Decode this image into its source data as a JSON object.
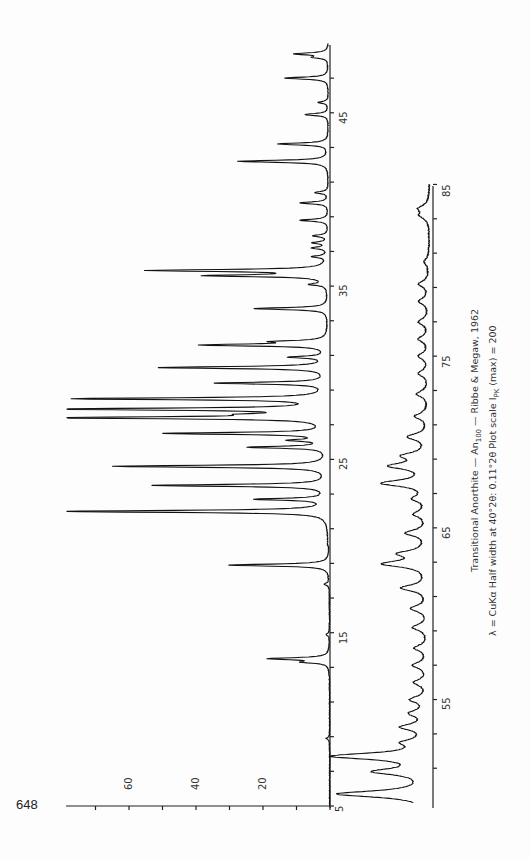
{
  "page": {
    "page_number": "648"
  },
  "caption": {
    "line1_prefix": "Transitional Anorthite — An",
    "line1_subscript": "100",
    "line1_suffix": " — Ribbe & Megaw, 1962",
    "line2_prefix": "λ = CuKα   Half width at 40°2θ: 0.11°2θ   Plot scale I",
    "line2_subscript": "PK",
    "line2_suffix": " (max) = 200"
  },
  "chart_data": {
    "type": "line",
    "title": "Transitional Anorthite — An100 — Ribbe & Megaw, 1962",
    "subtitle": "λ = CuKα  Half width at 40°2θ: 0.11°2θ  Plot scale I_PK (max) = 200",
    "xlabel": "2θ (degrees)",
    "ylabel": "Intensity",
    "orientation": "rotated 90° (2θ increases upward on page, intensity increases leftward)",
    "grid": false,
    "intensity_axis": {
      "ticks": [
        0,
        10,
        20,
        30,
        40,
        50,
        60,
        70
      ],
      "tick_labels": [
        "20",
        "40",
        "60"
      ],
      "range": [
        0,
        80
      ]
    },
    "series": [
      {
        "name": "upper trace (5–49° 2θ)",
        "xlim": [
          5,
          49
        ],
        "x_tick_labels": [
          "5",
          "15",
          "25",
          "35",
          "45"
        ],
        "x_ticks": [
          5,
          7,
          9,
          11,
          13,
          15,
          17,
          19,
          21,
          23,
          25,
          27,
          29,
          31,
          33,
          35,
          37,
          39,
          41,
          43,
          45,
          47
        ],
        "peaks": [
          {
            "two_theta": 8.9,
            "intensity": 1
          },
          {
            "two_theta": 13.3,
            "intensity": 7
          },
          {
            "two_theta": 13.5,
            "intensity": 18
          },
          {
            "two_theta": 14.9,
            "intensity": 1
          },
          {
            "two_theta": 17.8,
            "intensity": 1.5
          },
          {
            "two_theta": 18.9,
            "intensity": 30
          },
          {
            "two_theta": 22.0,
            "intensity": 80
          },
          {
            "two_theta": 22.7,
            "intensity": 21
          },
          {
            "two_theta": 23.5,
            "intensity": 52
          },
          {
            "two_theta": 24.6,
            "intensity": 64
          },
          {
            "two_theta": 25.7,
            "intensity": 23
          },
          {
            "two_theta": 26.1,
            "intensity": 10
          },
          {
            "two_theta": 26.5,
            "intensity": 48
          },
          {
            "two_theta": 27.4,
            "intensity": 80
          },
          {
            "two_theta": 27.6,
            "intensity": 15
          },
          {
            "two_theta": 27.9,
            "intensity": 80
          },
          {
            "two_theta": 28.5,
            "intensity": 75
          },
          {
            "two_theta": 29.4,
            "intensity": 33
          },
          {
            "two_theta": 30.3,
            "intensity": 50
          },
          {
            "two_theta": 30.9,
            "intensity": 11
          },
          {
            "two_theta": 31.6,
            "intensity": 37
          },
          {
            "two_theta": 31.8,
            "intensity": 14
          },
          {
            "two_theta": 33.7,
            "intensity": 22
          },
          {
            "two_theta": 35.1,
            "intensity": 5
          },
          {
            "two_theta": 35.6,
            "intensity": 35
          },
          {
            "two_theta": 35.9,
            "intensity": 53
          },
          {
            "two_theta": 36.7,
            "intensity": 4.5
          },
          {
            "two_theta": 37.2,
            "intensity": 4.5
          },
          {
            "two_theta": 37.5,
            "intensity": 4.5
          },
          {
            "two_theta": 37.9,
            "intensity": 4.5
          },
          {
            "two_theta": 38.8,
            "intensity": 8.5
          },
          {
            "two_theta": 39.8,
            "intensity": 8.5
          },
          {
            "two_theta": 40.4,
            "intensity": 4
          },
          {
            "two_theta": 42.2,
            "intensity": 27
          },
          {
            "two_theta": 43.2,
            "intensity": 15
          },
          {
            "two_theta": 44.9,
            "intensity": 7
          },
          {
            "two_theta": 45.6,
            "intensity": 3
          },
          {
            "two_theta": 47.0,
            "intensity": 13
          },
          {
            "two_theta": 48.2,
            "intensity": 4
          },
          {
            "two_theta": 48.4,
            "intensity": 10
          }
        ]
      },
      {
        "name": "lower trace (49–85° 2θ)",
        "xlim": [
          49,
          85
        ],
        "x_tick_labels": [
          "55",
          "65",
          "75",
          "85"
        ],
        "x_ticks": [
          51,
          53,
          55,
          57,
          59,
          61,
          63,
          65,
          67,
          69,
          71,
          73,
          75,
          77,
          79,
          81,
          83,
          85
        ],
        "peaks": [
          {
            "two_theta": 49.5,
            "intensity": 27
          },
          {
            "two_theta": 50.8,
            "intensity": 15
          },
          {
            "two_theta": 51.7,
            "intensity": 28
          },
          {
            "two_theta": 52.5,
            "intensity": 6
          },
          {
            "two_theta": 53.4,
            "intensity": 7.5
          },
          {
            "two_theta": 54.2,
            "intensity": 5
          },
          {
            "two_theta": 55.0,
            "intensity": 5
          },
          {
            "two_theta": 56.0,
            "intensity": 4
          },
          {
            "two_theta": 57.0,
            "intensity": 4.5
          },
          {
            "two_theta": 58.0,
            "intensity": 4
          },
          {
            "two_theta": 59.2,
            "intensity": 4.5
          },
          {
            "two_theta": 60.3,
            "intensity": 5
          },
          {
            "two_theta": 61.5,
            "intensity": 8
          },
          {
            "two_theta": 62.9,
            "intensity": 13
          },
          {
            "two_theta": 63.5,
            "intensity": 8
          },
          {
            "two_theta": 64.7,
            "intensity": 6.5
          },
          {
            "two_theta": 65.8,
            "intensity": 4
          },
          {
            "two_theta": 66.7,
            "intensity": 4
          },
          {
            "two_theta": 67.6,
            "intensity": 13.5
          },
          {
            "two_theta": 68.6,
            "intensity": 11
          },
          {
            "two_theta": 69.2,
            "intensity": 7
          },
          {
            "two_theta": 70.3,
            "intensity": 6
          },
          {
            "two_theta": 71.5,
            "intensity": 4
          },
          {
            "two_theta": 72.8,
            "intensity": 3.5
          },
          {
            "two_theta": 74.0,
            "intensity": 3
          },
          {
            "two_theta": 75.0,
            "intensity": 3
          },
          {
            "two_theta": 76.0,
            "intensity": 3
          },
          {
            "two_theta": 77.0,
            "intensity": 3
          },
          {
            "two_theta": 78.2,
            "intensity": 3
          },
          {
            "two_theta": 79.2,
            "intensity": 3
          },
          {
            "two_theta": 80.5,
            "intensity": 1.5
          },
          {
            "two_theta": 83.2,
            "intensity": 2.5
          },
          {
            "two_theta": 83.6,
            "intensity": 3
          }
        ]
      }
    ]
  }
}
